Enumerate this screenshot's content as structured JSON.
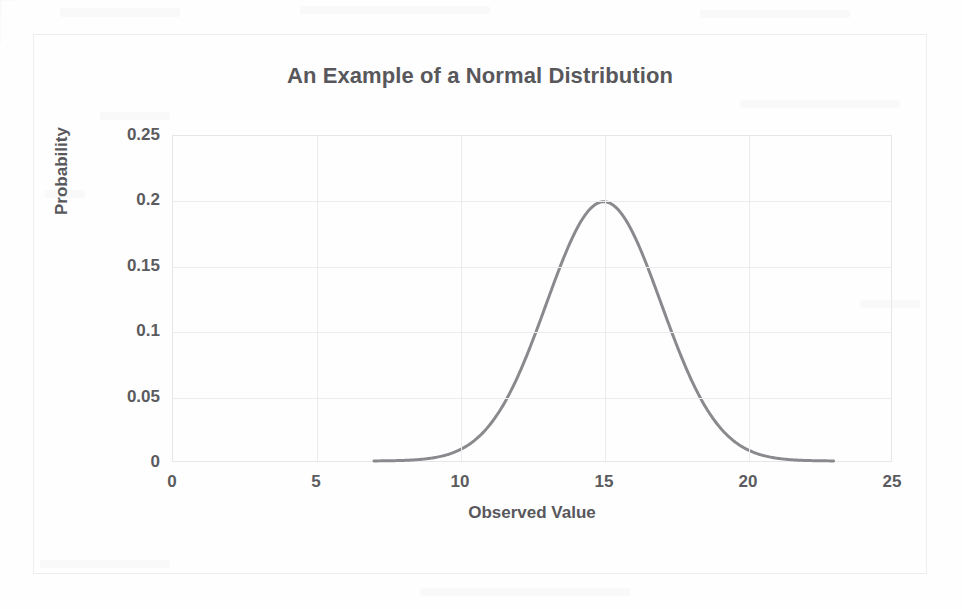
{
  "chart_data": {
    "type": "line",
    "title": "An Example of a Normal Distribution",
    "xlabel": "Observed Value",
    "ylabel": "Probability",
    "xlim": [
      0,
      25
    ],
    "ylim": [
      0,
      0.25
    ],
    "xticks": [
      "0",
      "5",
      "10",
      "15",
      "20",
      "25"
    ],
    "xtick_values": [
      0,
      5,
      10,
      15,
      20,
      25
    ],
    "yticks": [
      "0",
      "0.05",
      "0.1",
      "0.15",
      "0.2",
      "0.25"
    ],
    "ytick_values": [
      0,
      0.05,
      0.1,
      0.15,
      0.2,
      0.25
    ],
    "grid": "both",
    "legend": "none",
    "series": [
      {
        "name": "Normal distribution (mean 15, standard deviation 2)",
        "color": "#8a8a8e",
        "mean": 15,
        "std_dev": 2,
        "peak_value": 0.1995,
        "peak_x": 15,
        "x": [
          7,
          7.5,
          8,
          8.5,
          9,
          9.5,
          10,
          10.5,
          11,
          11.5,
          12,
          12.5,
          13,
          13.5,
          14,
          14.5,
          15,
          15.5,
          16,
          16.5,
          17,
          17.5,
          18,
          18.5,
          19,
          19.5,
          20,
          20.5,
          21,
          21.5,
          22,
          22.5,
          23
        ],
        "values": [
          0.0003,
          0.0007,
          0.0022,
          0.0051,
          0.0088,
          0.0175,
          0.0269,
          0.0388,
          0.0539,
          0.0713,
          0.0887,
          0.1074,
          0.124,
          0.1371,
          0.176,
          0.1863,
          0.1995,
          0.1863,
          0.176,
          0.1371,
          0.124,
          0.1074,
          0.0887,
          0.0713,
          0.0539,
          0.0388,
          0.0269,
          0.0175,
          0.0088,
          0.0051,
          0.0022,
          0.0007,
          0.0003
        ]
      }
    ],
    "colors": {
      "curve": "#8a8a8e",
      "gridline": "#ececef",
      "plot_border": "#e7e7ea",
      "outer_border": "#eeeef1",
      "text": "#58585c",
      "background": "#fefefe"
    }
  }
}
